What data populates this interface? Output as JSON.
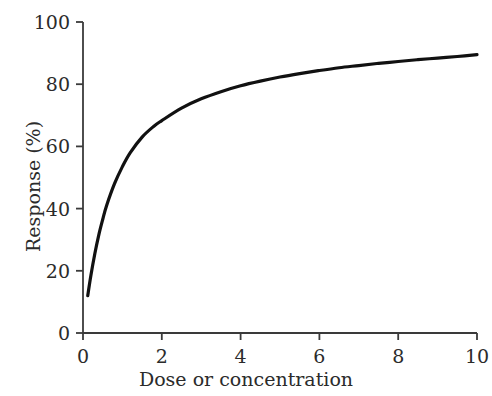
{
  "chart_data": {
    "type": "line",
    "title": "",
    "subtitle": "",
    "xlabel": "Dose or concentration",
    "ylabel": "Response (%)",
    "xlim": [
      0,
      10
    ],
    "ylim": [
      0,
      100
    ],
    "xticks": [
      0,
      2,
      4,
      6,
      8,
      10
    ],
    "xtick_labels": [
      "0",
      "2",
      "4",
      "6",
      "8",
      "10"
    ],
    "yticks": [
      0,
      20,
      40,
      60,
      80,
      100
    ],
    "ytick_labels": [
      "0",
      "20",
      "40",
      "60",
      "80",
      "100"
    ],
    "grid": false,
    "legend": false,
    "legend_position": "none",
    "tick_direction": "out",
    "spines": [
      "left",
      "bottom"
    ],
    "line_color": "#111111",
    "line_width": 3.2,
    "axis_color": "#3a3a3a",
    "background_color": "#ffffff",
    "text_color": "#2b2b2b",
    "annotations": [],
    "series": [
      {
        "name": "Dose-response curve",
        "x": [
          0.12,
          0.2,
          0.3,
          0.4,
          0.5,
          0.6,
          0.8,
          1.0,
          1.2,
          1.5,
          1.8,
          2.0,
          2.5,
          3.0,
          3.5,
          4.0,
          4.5,
          5.0,
          5.5,
          6.0,
          6.5,
          7.0,
          7.5,
          8.0,
          8.5,
          9.0,
          9.5,
          10.0
        ],
        "y": [
          12.0,
          18.5,
          25.5,
          31.5,
          36.5,
          41.0,
          48.0,
          53.5,
          58.0,
          63.0,
          66.5,
          68.3,
          72.3,
          75.3,
          77.6,
          79.5,
          81.0,
          82.3,
          83.4,
          84.4,
          85.3,
          86.0,
          86.7,
          87.3,
          87.9,
          88.4,
          88.9,
          89.5
        ]
      }
    ]
  },
  "geometry": {
    "plot_left": 83,
    "plot_right": 477,
    "plot_top": 22,
    "plot_bottom": 333
  }
}
